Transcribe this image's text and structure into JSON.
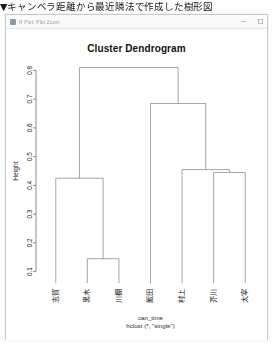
{
  "document": {
    "heading": "▼キャンベラ距離から最近隣法で作成した樹形図"
  },
  "window": {
    "title": "R Plot: Plot Zoom",
    "icon": "plot-window-icon",
    "controls": {
      "minimize": "minimize-icon",
      "maximize": "maximize-icon"
    }
  },
  "chart_data": {
    "type": "dendrogram",
    "title": "Cluster Dendrogram",
    "xlabel": "can_time",
    "sublabel": "hclust (*, \"single\")",
    "ylabel": "Height",
    "ylim": [
      0.06,
      0.84
    ],
    "yticks": [
      0.1,
      0.2,
      0.3,
      0.4,
      0.5,
      0.6,
      0.7,
      0.8
    ],
    "ytick_labels": [
      "0.1",
      "0.2",
      "0.3",
      "0.4",
      "0.5",
      "0.6",
      "0.7",
      "0.8"
    ],
    "grid": false,
    "legend": "none",
    "linkage": "single",
    "distance": "canberra",
    "leaf_order": [
      "志賀",
      "黒木",
      "川棚",
      "飯田",
      "村上",
      "芥川",
      "太宰"
    ],
    "leaf_count": 7,
    "merges": [
      {
        "id": 1,
        "left": "黒木",
        "right": "川棚",
        "height": 0.145
      },
      {
        "id": 2,
        "left": "志賀",
        "right": "m1",
        "height": 0.425
      },
      {
        "id": 3,
        "left": "芥川",
        "right": "太宰",
        "height": 0.445
      },
      {
        "id": 4,
        "left": "村上",
        "right": "m3",
        "height": 0.455
      },
      {
        "id": 5,
        "left": "飯田",
        "right": "m4",
        "height": 0.685
      },
      {
        "id": 6,
        "left": "m2",
        "right": "m5",
        "height": 0.81
      }
    ],
    "colors": {
      "line": "#6e6e6e",
      "axis": "#5a5a5a",
      "background": "#ffffff",
      "text": "#1c1c1c"
    }
  }
}
